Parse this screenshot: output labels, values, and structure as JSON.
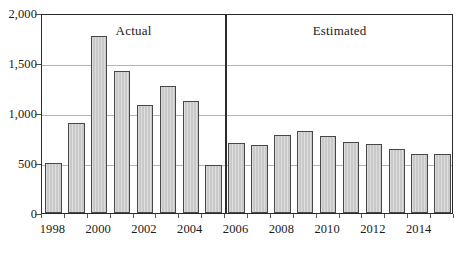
{
  "chart_data": {
    "type": "bar",
    "title": "",
    "subtitle": "",
    "xlabel": "",
    "ylabel": "",
    "ylim": [
      0,
      2000
    ],
    "ytick_values": [
      0,
      500,
      1000,
      1500,
      2000
    ],
    "ytick_labels": [
      "0",
      "500",
      "1,000",
      "1,500",
      "2,000"
    ],
    "grid": true,
    "legend": "none",
    "categories": [
      "1998",
      "1999",
      "2000",
      "2001",
      "2002",
      "2003",
      "2004",
      "2005",
      "2006",
      "2007",
      "2008",
      "2009",
      "2010",
      "2011",
      "2012",
      "2013",
      "2014",
      "2015"
    ],
    "values": [
      500,
      900,
      1775,
      1425,
      1085,
      1270,
      1120,
      480,
      700,
      685,
      780,
      820,
      775,
      710,
      690,
      640,
      590,
      590
    ],
    "xtick_labels": [
      "1998",
      "2000",
      "2002",
      "2004",
      "2006",
      "2008",
      "2010",
      "2012",
      "2014"
    ],
    "xtick_categories": [
      "1998",
      "2000",
      "2002",
      "2004",
      "2006",
      "2008",
      "2010",
      "2012",
      "2014"
    ],
    "annotations": [
      {
        "text": "Actual",
        "category_span": [
          "1998",
          "2005"
        ]
      },
      {
        "text": "Estimated",
        "category_span": [
          "2006",
          "2015"
        ]
      }
    ],
    "divider_after_category": "2005",
    "bar_fill_color": "#c9c9c9",
    "bar_border_color": "#474747",
    "gridline_color": "#b4b4b4",
    "axis_color": "#2b2b2b"
  },
  "annotations": {
    "actual_label": "Actual",
    "estimated_label": "Estimated"
  }
}
